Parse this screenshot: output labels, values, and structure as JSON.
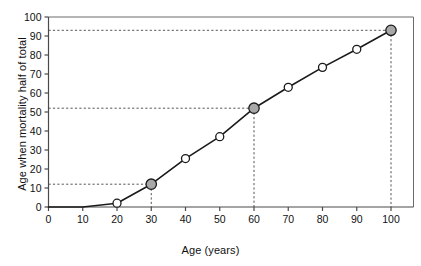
{
  "chart_data": {
    "type": "line",
    "title": "",
    "xlabel": "Age (years)",
    "ylabel": "Age when mortality half of total",
    "xlim": [
      0,
      100
    ],
    "ylim": [
      0,
      100
    ],
    "xticks": [
      0,
      10,
      20,
      30,
      40,
      50,
      60,
      70,
      80,
      90,
      100
    ],
    "yticks": [
      0,
      10,
      20,
      30,
      40,
      50,
      60,
      70,
      80,
      90,
      100
    ],
    "grid": false,
    "legend": null,
    "series": [
      {
        "name": "Age when mortality half of total",
        "x": [
          0,
          10,
          20,
          30,
          40,
          50,
          60,
          70,
          80,
          90,
          100
        ],
        "values": [
          0,
          0,
          2,
          12,
          25.5,
          37,
          52,
          63,
          73.5,
          83,
          93
        ],
        "marker_style": "circle",
        "line_color": "#1a1a1a",
        "marker_open_fill": "#ffffff",
        "marker_highlight_fill": "#a8a8a8",
        "marker_edge_color": "#1a1a1a",
        "highlighted_x": [
          30,
          60,
          100
        ]
      }
    ],
    "annotations": [
      {
        "type": "reference-line",
        "style": "dashed",
        "x": 30,
        "y": 12,
        "label": ""
      },
      {
        "type": "reference-line",
        "style": "dashed",
        "x": 60,
        "y": 52,
        "label": ""
      },
      {
        "type": "reference-line",
        "style": "dashed",
        "x": 100,
        "y": 93,
        "label": ""
      }
    ]
  },
  "axes": {
    "x_title": "Age (years)",
    "y_title": "Age when mortality half of total",
    "x_tick_labels": [
      "0",
      "10",
      "20",
      "30",
      "40",
      "50",
      "60",
      "70",
      "80",
      "90",
      "100"
    ],
    "y_tick_labels": [
      "0",
      "10",
      "20",
      "30",
      "40",
      "50",
      "60",
      "70",
      "80",
      "90",
      "100"
    ]
  },
  "colors": {
    "line": "#1a1a1a",
    "axis": "#4a4a4a",
    "frame": "#6b6b6b",
    "marker_fill_open": "#ffffff",
    "marker_fill_highlight": "#a8a8a8",
    "dashed_guide": "#555555",
    "background": "#ffffff",
    "text": "#111111"
  }
}
